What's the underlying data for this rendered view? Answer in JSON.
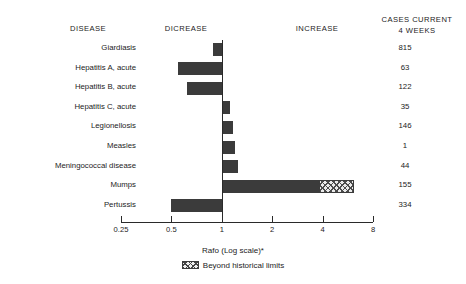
{
  "headers": {
    "disease": "DISEASE",
    "decrease": "DICREASE",
    "increase": "INCREASE",
    "cases_line1": "CASES CURRENT",
    "cases_line2": "4 WEEKS"
  },
  "axis": {
    "title": "Rafo (Log scale)*",
    "tick_labels": [
      "0.25",
      "0.5",
      "1",
      "2",
      "4",
      "8"
    ]
  },
  "legend": {
    "label": "Beyond historical limits"
  },
  "colors": {
    "bar": "#3b3b3b",
    "hatch_line": "#4a4a4a",
    "hatch_fill": "#e9e9e9",
    "axis": "#2a2a2a",
    "text": "#1c1c1c",
    "background": "#ffffff"
  },
  "rows": [
    {
      "disease": "Giardiasis",
      "cases": "815"
    },
    {
      "disease": "Hepatitis A, acute",
      "cases": "63"
    },
    {
      "disease": "Hepatitis B, acute",
      "cases": "122"
    },
    {
      "disease": "Hepatitis C, acute",
      "cases": "35"
    },
    {
      "disease": "Legionellosis",
      "cases": "146"
    },
    {
      "disease": "Measles",
      "cases": "1"
    },
    {
      "disease": "Meningococcal disease",
      "cases": "44"
    },
    {
      "disease": "Mumps",
      "cases": "155"
    },
    {
      "disease": "Pertussis",
      "cases": "334"
    }
  ],
  "chart_data": {
    "type": "bar",
    "orientation": "horizontal",
    "title": "",
    "xlabel": "Rafo (Log scale)*",
    "ylabel": "DISEASE",
    "xscale": "log",
    "xlim": [
      0.25,
      8
    ],
    "baseline": 1,
    "grid": false,
    "legend_position": "bottom",
    "xticks": [
      0.25,
      0.5,
      1,
      2,
      4,
      8
    ],
    "xtick_labels": [
      "0.25",
      "0.5",
      "1",
      "2",
      "4",
      "8"
    ],
    "categories": [
      "Giardiasis",
      "Hepatitis A, acute",
      "Hepatitis B, acute",
      "Hepatitis C, acute",
      "Legionellosis",
      "Measles",
      "Meningococcal disease",
      "Mumps",
      "Pertussis"
    ],
    "series": [
      {
        "name": "Ratio to historical mean",
        "values": [
          0.88,
          0.55,
          0.62,
          1.12,
          1.17,
          1.2,
          1.25,
          3.8,
          0.5
        ]
      },
      {
        "name": "Beyond historical limits",
        "values": [
          null,
          null,
          null,
          null,
          null,
          null,
          null,
          6.2,
          null
        ]
      }
    ],
    "cases_current_4_weeks": [
      815,
      63,
      122,
      35,
      146,
      1,
      44,
      155,
      334
    ],
    "annotations": [
      "DICREASE",
      "INCREASE",
      "CASES CURRENT 4 WEEKS"
    ]
  }
}
